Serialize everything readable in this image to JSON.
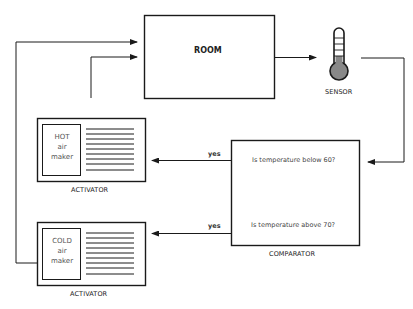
{
  "diagram": {
    "title": "",
    "room": {
      "label": "ROOM"
    },
    "sensor": {
      "label": "SENSOR",
      "icon": "thermometer-icon"
    },
    "comparator": {
      "label": "COMPARATOR",
      "question_low": "Is temperature below 60?",
      "question_high": "Is temperature above 70?"
    },
    "activators": [
      {
        "label": "ACTIVATOR",
        "maker_line1": "HOT",
        "maker_line2": "air",
        "maker_line3": "maker",
        "edge_label": "yes"
      },
      {
        "label": "ACTIVATOR",
        "maker_line1": "COLD",
        "maker_line2": "air",
        "maker_line3": "maker",
        "edge_label": "yes"
      }
    ],
    "edges": [
      {
        "from": "room",
        "to": "sensor"
      },
      {
        "from": "sensor",
        "to": "comparator"
      },
      {
        "from": "comparator",
        "to": "hot-activator",
        "label": "yes"
      },
      {
        "from": "comparator",
        "to": "cold-activator",
        "label": "yes"
      },
      {
        "from": "hot-activator",
        "to": "room"
      },
      {
        "from": "cold-activator",
        "to": "room"
      }
    ],
    "colors": {
      "line": "#1a1a1a",
      "bulb": "#888888"
    }
  }
}
